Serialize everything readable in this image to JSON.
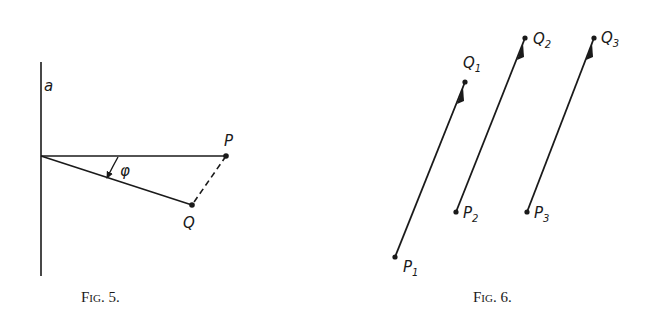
{
  "fig5": {
    "caption": {
      "prefix": "F",
      "small": "IG",
      "suffix": ". 5."
    },
    "labels": {
      "axis": "a",
      "point_p": "P",
      "point_q": "Q",
      "angle": "φ"
    },
    "elements": {
      "axis_line": {
        "x1": 41,
        "y1": 62,
        "x2": 41,
        "y2": 276
      },
      "op_line": {
        "x1": 41,
        "y1": 156,
        "x2": 226,
        "y2": 156
      },
      "oq_line": {
        "x1": 41,
        "y1": 156,
        "x2": 192,
        "y2": 205
      },
      "pq_dashed": {
        "x1": 226,
        "y1": 156,
        "x2": 192,
        "y2": 205
      }
    }
  },
  "fig6": {
    "caption": {
      "prefix": "F",
      "small": "IG",
      "suffix": ". 6."
    },
    "vectors": [
      {
        "from_label": "P",
        "from_sub": "1",
        "to_label": "Q",
        "to_sub": "1",
        "from": [
          395,
          257
        ],
        "to": [
          465,
          82
        ]
      },
      {
        "from_label": "P",
        "from_sub": "2",
        "to_label": "Q",
        "to_sub": "2",
        "from": [
          456,
          212
        ],
        "to": [
          525,
          38
        ]
      },
      {
        "from_label": "P",
        "from_sub": "3",
        "to_label": "Q",
        "to_sub": "3",
        "from": [
          527,
          212
        ],
        "to": [
          594,
          38
        ]
      }
    ]
  },
  "colors": {
    "ink": "#1a1a1a",
    "background": "#ffffff"
  }
}
